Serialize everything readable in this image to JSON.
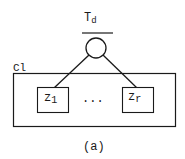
{
  "diagram": {
    "root_label": "T",
    "root_label_sub": "d",
    "container_label": "Cl",
    "children": [
      {
        "label": "z",
        "sub": "1"
      },
      {
        "label": "z",
        "sub": "r"
      }
    ],
    "ellipsis": "...",
    "caption": "(a)"
  },
  "colors": {
    "stroke": "#1a1a1a",
    "background": "#ffffff"
  }
}
